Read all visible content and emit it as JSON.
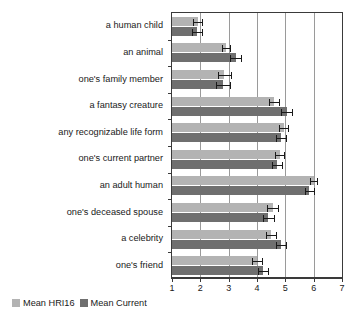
{
  "chart_data": {
    "type": "bar",
    "orientation": "horizontal",
    "title": "",
    "xlabel": "",
    "ylabel": "",
    "xlim": [
      1,
      7
    ],
    "xticks": [
      1,
      2,
      3,
      4,
      5,
      6,
      7
    ],
    "grid": true,
    "grid_axis": "x",
    "legend_position": "bottom-left",
    "categories": [
      "a human child",
      "an animal",
      "one's family member",
      "a fantasy creature",
      "any recognizable life form",
      "one's current partner",
      "an adult human",
      "one's deceased spouse",
      "a celebrity",
      "one's friend"
    ],
    "series": [
      {
        "name": "Mean HRI16",
        "color": "#b3b3b3",
        "values": [
          1.9,
          2.9,
          2.85,
          4.6,
          4.95,
          4.8,
          6.0,
          4.55,
          4.5,
          4.0
        ],
        "errors": [
          0.16,
          0.15,
          0.22,
          0.18,
          0.16,
          0.17,
          0.13,
          0.19,
          0.18,
          0.19
        ]
      },
      {
        "name": "Mean Current",
        "color": "#6f6f6f",
        "values": [
          1.88,
          3.25,
          2.8,
          5.05,
          4.85,
          4.7,
          5.85,
          4.4,
          4.85,
          4.2
        ],
        "errors": [
          0.17,
          0.2,
          0.24,
          0.2,
          0.18,
          0.18,
          0.16,
          0.2,
          0.17,
          0.18
        ]
      }
    ]
  },
  "legend": {
    "items": [
      {
        "label": "Mean HRI16"
      },
      {
        "label": "Mean Current"
      }
    ]
  }
}
